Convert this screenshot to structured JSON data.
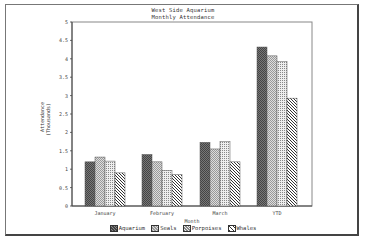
{
  "chart_data": {
    "type": "bar",
    "title": "West Side Aquarium",
    "subtitle": "Monthly Attendance",
    "xlabel": "Month",
    "ylabel": "Attendance",
    "ylabel2": "(Thousands)",
    "categories": [
      "January",
      "February",
      "March",
      "YTD"
    ],
    "series": [
      {
        "name": "Aquarium",
        "values": [
          1.2,
          1.4,
          1.73,
          4.32
        ]
      },
      {
        "name": "Seals",
        "values": [
          1.33,
          1.2,
          1.55,
          4.08
        ]
      },
      {
        "name": "Porpoises",
        "values": [
          1.22,
          0.97,
          1.75,
          3.92
        ]
      },
      {
        "name": "Whales",
        "values": [
          0.9,
          0.85,
          1.2,
          2.93
        ]
      }
    ],
    "ylim": [
      0,
      5
    ],
    "yticks": [
      "0",
      "0.5",
      "1",
      "1.5",
      "2",
      "2.5",
      "3",
      "3.5",
      "4",
      "4.5",
      "5"
    ],
    "grid": false,
    "legend_position": "bottom"
  }
}
